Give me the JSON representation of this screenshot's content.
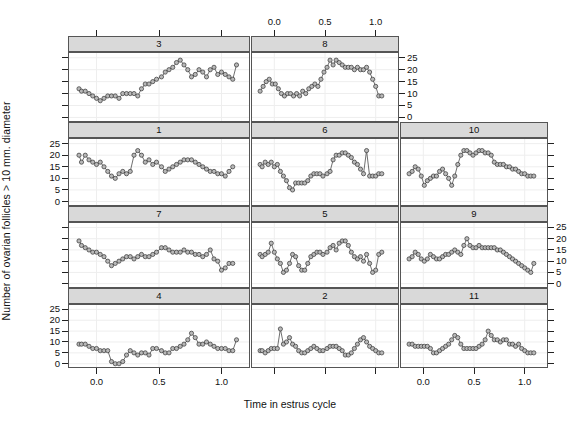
{
  "labels": {
    "ylab": "Number of ovarian follicles > 10 mm. diameter",
    "xlab": "Time in estrus cycle"
  },
  "axis": {
    "x_ticks": [
      "0.0",
      "0.5",
      "1.0"
    ],
    "x_tick_values": [
      0.0,
      0.5,
      1.0
    ],
    "y_ticks": [
      "0",
      "5",
      "10",
      "15",
      "20",
      "25"
    ],
    "y_tick_values": [
      0,
      5,
      10,
      15,
      20,
      25
    ],
    "xlim": [
      -0.22,
      1.22
    ],
    "ylim": [
      -1.5,
      27.0
    ],
    "grid": true
  },
  "style": {
    "strip_fill": "#d9d9d9",
    "strip_border": "#555555",
    "panel_border": "#555555",
    "point_fill": "#b8b8b8",
    "point_stroke": "#333333",
    "line_color": "#4a4a4a",
    "grid_color": "#eeeeee"
  },
  "strips": [
    {
      "label": "3"
    },
    {
      "label": "8"
    },
    {
      "label": "1"
    },
    {
      "label": "6"
    },
    {
      "label": "10"
    },
    {
      "label": "7"
    },
    {
      "label": "5"
    },
    {
      "label": "9"
    },
    {
      "label": "4"
    },
    {
      "label": "2"
    },
    {
      "label": "11"
    }
  ],
  "chart_data": {
    "type": "line",
    "title": "",
    "xlabel": "Time in estrus cycle",
    "ylabel": "Number of ovarian follicles > 10 mm. diameter",
    "xlim": [
      -0.22,
      1.22
    ],
    "ylim": [
      -1.5,
      27.0
    ],
    "grid": true,
    "legend_position": "none",
    "panel_layout": {
      "rows": 4,
      "cols": 3,
      "row1_cols_used": 2
    },
    "panels": [
      {
        "label": "3",
        "row": 1,
        "col": 1,
        "x": [
          -0.14,
          -0.12,
          -0.09,
          -0.06,
          -0.03,
          0.0,
          0.03,
          0.06,
          0.09,
          0.12,
          0.15,
          0.18,
          0.21,
          0.24,
          0.27,
          0.3,
          0.33,
          0.36,
          0.39,
          0.42,
          0.45,
          0.48,
          0.52,
          0.55,
          0.58,
          0.61,
          0.64,
          0.67,
          0.7,
          0.73,
          0.76,
          0.79,
          0.82,
          0.85,
          0.88,
          0.91,
          0.94,
          0.97,
          1.0,
          1.03,
          1.06,
          1.09,
          1.12
        ],
        "y": [
          12,
          11,
          11,
          10,
          9,
          8,
          7,
          8,
          9,
          9,
          9,
          8,
          10,
          10,
          10,
          10,
          9,
          12,
          14,
          14,
          15,
          16,
          17,
          19,
          20,
          21,
          23,
          24,
          22,
          20,
          17,
          18,
          20,
          19,
          17,
          20,
          21,
          18,
          19,
          18,
          17,
          16,
          22
        ]
      },
      {
        "label": "8",
        "row": 1,
        "col": 2,
        "x": [
          -0.14,
          -0.11,
          -0.08,
          -0.05,
          -0.02,
          0.01,
          0.04,
          0.07,
          0.1,
          0.13,
          0.16,
          0.19,
          0.22,
          0.25,
          0.28,
          0.31,
          0.34,
          0.37,
          0.4,
          0.43,
          0.46,
          0.49,
          0.52,
          0.55,
          0.58,
          0.61,
          0.64,
          0.67,
          0.7,
          0.73,
          0.76,
          0.79,
          0.82,
          0.85,
          0.88,
          0.91,
          0.94,
          0.97,
          1.0,
          1.03,
          1.06
        ],
        "y": [
          11,
          13,
          15,
          16,
          14,
          14,
          12,
          10,
          9,
          10,
          10,
          9,
          10,
          9,
          11,
          10,
          12,
          13,
          14,
          13,
          16,
          19,
          21,
          24,
          22,
          24,
          23,
          22,
          21,
          21,
          21,
          20,
          21,
          20,
          20,
          21,
          19,
          16,
          13,
          9,
          9
        ]
      },
      {
        "label": "1",
        "row": 2,
        "col": 1,
        "x": [
          -0.14,
          -0.12,
          -0.09,
          -0.06,
          -0.03,
          0.0,
          0.03,
          0.06,
          0.09,
          0.12,
          0.15,
          0.18,
          0.21,
          0.24,
          0.27,
          0.3,
          0.33,
          0.36,
          0.39,
          0.42,
          0.45,
          0.48,
          0.52,
          0.55,
          0.58,
          0.61,
          0.64,
          0.67,
          0.7,
          0.73,
          0.76,
          0.79,
          0.82,
          0.85,
          0.88,
          0.91,
          0.94,
          0.97,
          1.0,
          1.03,
          1.06,
          1.09
        ],
        "y": [
          20,
          17,
          20,
          18,
          17,
          16,
          17,
          15,
          13,
          11,
          10,
          12,
          13,
          12,
          13,
          20,
          22,
          20,
          17,
          18,
          16,
          17,
          15,
          13,
          14,
          15,
          16,
          17,
          18,
          18,
          18,
          17,
          16,
          15,
          14,
          13,
          13,
          12,
          12,
          11,
          13,
          15
        ]
      },
      {
        "label": "6",
        "row": 2,
        "col": 2,
        "x": [
          -0.14,
          -0.12,
          -0.09,
          -0.06,
          -0.03,
          0.0,
          0.03,
          0.06,
          0.09,
          0.12,
          0.15,
          0.18,
          0.21,
          0.24,
          0.27,
          0.3,
          0.33,
          0.36,
          0.39,
          0.42,
          0.45,
          0.48,
          0.52,
          0.55,
          0.58,
          0.61,
          0.64,
          0.67,
          0.7,
          0.73,
          0.76,
          0.79,
          0.82,
          0.85,
          0.88,
          0.91,
          0.94,
          0.97,
          1.0,
          1.03,
          1.06
        ],
        "y": [
          16,
          15,
          17,
          16,
          17,
          15,
          16,
          13,
          11,
          9,
          6,
          5,
          8,
          8,
          8,
          8,
          9,
          11,
          12,
          12,
          12,
          11,
          12,
          13,
          18,
          20,
          20,
          21,
          21,
          20,
          19,
          17,
          16,
          14,
          12,
          22,
          11,
          11,
          11,
          12,
          12
        ]
      },
      {
        "label": "10",
        "row": 2,
        "col": 3,
        "x": [
          -0.14,
          -0.11,
          -0.08,
          -0.05,
          -0.02,
          0.01,
          0.04,
          0.07,
          0.1,
          0.13,
          0.16,
          0.19,
          0.22,
          0.25,
          0.28,
          0.31,
          0.34,
          0.37,
          0.4,
          0.43,
          0.46,
          0.49,
          0.52,
          0.55,
          0.58,
          0.61,
          0.64,
          0.67,
          0.7,
          0.73,
          0.76,
          0.79,
          0.82,
          0.85,
          0.88,
          0.91,
          0.94,
          0.97,
          1.0,
          1.03,
          1.06,
          1.09
        ],
        "y": [
          12,
          13,
          15,
          14,
          11,
          7,
          9,
          10,
          11,
          11,
          13,
          14,
          12,
          10,
          7,
          11,
          16,
          20,
          22,
          22,
          21,
          20,
          21,
          22,
          22,
          21,
          21,
          20,
          17,
          16,
          16,
          16,
          15,
          15,
          14,
          14,
          13,
          12,
          12,
          11,
          11,
          11
        ]
      },
      {
        "label": "7",
        "row": 3,
        "col": 1,
        "x": [
          -0.14,
          -0.12,
          -0.09,
          -0.06,
          -0.03,
          0.0,
          0.03,
          0.06,
          0.09,
          0.12,
          0.15,
          0.18,
          0.21,
          0.24,
          0.27,
          0.3,
          0.33,
          0.36,
          0.39,
          0.42,
          0.45,
          0.48,
          0.52,
          0.55,
          0.58,
          0.61,
          0.64,
          0.67,
          0.7,
          0.73,
          0.76,
          0.79,
          0.82,
          0.85,
          0.88,
          0.91,
          0.94,
          0.97,
          1.0,
          1.03,
          1.06,
          1.09
        ],
        "y": [
          19,
          17,
          16,
          15,
          14,
          14,
          13,
          12,
          10,
          8,
          9,
          10,
          11,
          12,
          12,
          11,
          12,
          13,
          12,
          12,
          13,
          14,
          16,
          16,
          15,
          14,
          14,
          14,
          15,
          14,
          14,
          13,
          13,
          12,
          13,
          15,
          11,
          10,
          6,
          7,
          9,
          9
        ]
      },
      {
        "label": "5",
        "row": 3,
        "col": 2,
        "x": [
          -0.14,
          -0.12,
          -0.09,
          -0.06,
          -0.03,
          0.0,
          0.03,
          0.06,
          0.09,
          0.12,
          0.15,
          0.18,
          0.21,
          0.24,
          0.27,
          0.3,
          0.33,
          0.36,
          0.39,
          0.42,
          0.45,
          0.48,
          0.52,
          0.55,
          0.58,
          0.61,
          0.64,
          0.67,
          0.7,
          0.73,
          0.76,
          0.79,
          0.82,
          0.85,
          0.88,
          0.91,
          0.94,
          0.97,
          1.0,
          1.03,
          1.06
        ],
        "y": [
          13,
          12,
          13,
          14,
          18,
          14,
          11,
          9,
          5,
          6,
          9,
          13,
          12,
          8,
          6,
          6,
          9,
          12,
          13,
          14,
          14,
          13,
          14,
          16,
          17,
          15,
          18,
          19,
          19,
          17,
          14,
          12,
          11,
          12,
          10,
          13,
          9,
          5,
          6,
          13,
          14
        ]
      },
      {
        "label": "9",
        "row": 3,
        "col": 3,
        "x": [
          -0.14,
          -0.11,
          -0.08,
          -0.05,
          -0.02,
          0.01,
          0.04,
          0.07,
          0.1,
          0.13,
          0.16,
          0.19,
          0.22,
          0.25,
          0.28,
          0.31,
          0.34,
          0.37,
          0.4,
          0.43,
          0.46,
          0.49,
          0.52,
          0.55,
          0.58,
          0.61,
          0.64,
          0.67,
          0.7,
          0.73,
          0.76,
          0.79,
          0.82,
          0.85,
          0.88,
          0.91,
          0.94,
          0.97,
          1.0,
          1.03,
          1.06,
          1.09
        ],
        "y": [
          11,
          12,
          14,
          13,
          11,
          10,
          11,
          13,
          12,
          11,
          11,
          12,
          13,
          13,
          14,
          15,
          14,
          13,
          17,
          20,
          17,
          16,
          16,
          17,
          16,
          16,
          16,
          16,
          16,
          15,
          15,
          14,
          13,
          12,
          11,
          10,
          9,
          8,
          7,
          6,
          5,
          9
        ]
      },
      {
        "label": "4",
        "row": 4,
        "col": 1,
        "x": [
          -0.14,
          -0.12,
          -0.09,
          -0.06,
          -0.03,
          0.0,
          0.03,
          0.06,
          0.09,
          0.12,
          0.15,
          0.18,
          0.21,
          0.24,
          0.27,
          0.3,
          0.33,
          0.36,
          0.39,
          0.42,
          0.45,
          0.48,
          0.52,
          0.55,
          0.58,
          0.61,
          0.64,
          0.67,
          0.7,
          0.73,
          0.76,
          0.79,
          0.82,
          0.85,
          0.88,
          0.91,
          0.94,
          0.97,
          1.0,
          1.03,
          1.06,
          1.09,
          1.12
        ],
        "y": [
          9,
          9,
          9,
          8,
          7,
          7,
          6,
          6,
          6,
          1,
          0,
          0,
          1,
          4,
          6,
          5,
          4,
          5,
          5,
          4,
          7,
          7,
          6,
          5,
          5,
          7,
          7,
          8,
          9,
          11,
          14,
          12,
          9,
          9,
          10,
          9,
          8,
          7,
          7,
          7,
          6,
          6,
          11
        ]
      },
      {
        "label": "2",
        "row": 4,
        "col": 2,
        "x": [
          -0.14,
          -0.12,
          -0.09,
          -0.06,
          -0.03,
          0.0,
          0.03,
          0.06,
          0.09,
          0.12,
          0.15,
          0.18,
          0.21,
          0.24,
          0.27,
          0.3,
          0.33,
          0.36,
          0.39,
          0.42,
          0.45,
          0.48,
          0.52,
          0.55,
          0.58,
          0.61,
          0.64,
          0.67,
          0.7,
          0.73,
          0.76,
          0.79,
          0.82,
          0.85,
          0.88,
          0.91,
          0.94,
          0.97,
          1.0,
          1.03,
          1.06
        ],
        "y": [
          6,
          6,
          5,
          6,
          7,
          7,
          7,
          16,
          9,
          10,
          12,
          9,
          8,
          6,
          5,
          5,
          6,
          7,
          8,
          7,
          6,
          6,
          7,
          8,
          8,
          8,
          7,
          6,
          4,
          4,
          5,
          7,
          9,
          11,
          12,
          10,
          8,
          7,
          6,
          5,
          5
        ]
      },
      {
        "label": "11",
        "row": 4,
        "col": 3,
        "x": [
          -0.14,
          -0.11,
          -0.08,
          -0.05,
          -0.02,
          0.01,
          0.04,
          0.07,
          0.1,
          0.13,
          0.16,
          0.19,
          0.22,
          0.25,
          0.28,
          0.31,
          0.34,
          0.37,
          0.4,
          0.43,
          0.46,
          0.49,
          0.52,
          0.55,
          0.58,
          0.61,
          0.64,
          0.67,
          0.7,
          0.73,
          0.76,
          0.79,
          0.82,
          0.85,
          0.88,
          0.91,
          0.94,
          0.97,
          1.0,
          1.03,
          1.06,
          1.09
        ],
        "y": [
          9,
          9,
          8,
          8,
          8,
          8,
          8,
          7,
          5,
          5,
          6,
          7,
          8,
          9,
          11,
          13,
          12,
          9,
          7,
          7,
          7,
          7,
          7,
          8,
          9,
          11,
          15,
          13,
          11,
          11,
          10,
          11,
          11,
          9,
          9,
          8,
          9,
          7,
          6,
          5,
          5,
          5
        ]
      }
    ]
  }
}
